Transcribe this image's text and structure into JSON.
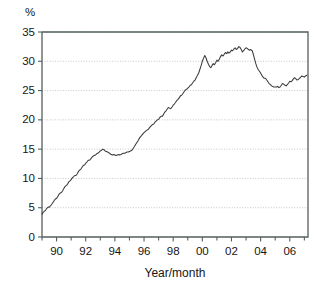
{
  "chart_data": {
    "type": "line",
    "title": "",
    "subtitle": "",
    "xlabel": "Year/month",
    "ylabel": "",
    "unit_label": "%",
    "ylim": [
      0,
      35
    ],
    "xlim": [
      1989.0,
      2007.25
    ],
    "grid": true,
    "legend": false,
    "legend_position": "none",
    "yticks": [
      0,
      5,
      10,
      15,
      20,
      25,
      30,
      35
    ],
    "ytick_labels": [
      "0",
      "5",
      "10",
      "15",
      "20",
      "25",
      "30",
      "35"
    ],
    "xticks": [
      1990,
      1992,
      1994,
      1996,
      1998,
      2000,
      2002,
      2004,
      2006
    ],
    "xtick_labels": [
      "90",
      "92",
      "94",
      "96",
      "98",
      "00",
      "02",
      "04",
      "06"
    ],
    "xtick_minor": [
      1989,
      1991,
      1993,
      1995,
      1997,
      1999,
      2001,
      2003,
      2005,
      2007
    ],
    "line_color": "#3a3a3a",
    "grid_color": "#b9b9b9",
    "axis_color": "#555f5f",
    "series": [
      {
        "name": "percentage",
        "x": [
          1989.0,
          1989.08,
          1989.17,
          1989.25,
          1989.33,
          1989.42,
          1989.5,
          1989.58,
          1989.67,
          1989.75,
          1989.83,
          1989.92,
          1990.0,
          1990.08,
          1990.17,
          1990.25,
          1990.33,
          1990.42,
          1990.5,
          1990.58,
          1990.67,
          1990.75,
          1990.83,
          1990.92,
          1991.0,
          1991.08,
          1991.17,
          1991.25,
          1991.33,
          1991.42,
          1991.5,
          1991.58,
          1991.67,
          1991.75,
          1991.83,
          1991.92,
          1992.0,
          1992.08,
          1992.17,
          1992.25,
          1992.33,
          1992.42,
          1992.5,
          1992.58,
          1992.67,
          1992.75,
          1992.83,
          1992.92,
          1993.0,
          1993.08,
          1993.17,
          1993.25,
          1993.33,
          1993.42,
          1993.5,
          1993.58,
          1993.67,
          1993.75,
          1993.83,
          1993.92,
          1994.0,
          1994.08,
          1994.17,
          1994.25,
          1994.33,
          1994.42,
          1994.5,
          1994.58,
          1994.67,
          1994.75,
          1994.83,
          1994.92,
          1995.0,
          1995.08,
          1995.17,
          1995.25,
          1995.33,
          1995.42,
          1995.5,
          1995.58,
          1995.67,
          1995.75,
          1995.83,
          1995.92,
          1996.0,
          1996.08,
          1996.17,
          1996.25,
          1996.33,
          1996.42,
          1996.5,
          1996.58,
          1996.67,
          1996.75,
          1996.83,
          1996.92,
          1997.0,
          1997.08,
          1997.17,
          1997.25,
          1997.33,
          1997.42,
          1997.5,
          1997.58,
          1997.67,
          1997.75,
          1997.83,
          1997.92,
          1998.0,
          1998.08,
          1998.17,
          1998.25,
          1998.33,
          1998.42,
          1998.5,
          1998.58,
          1998.67,
          1998.75,
          1998.83,
          1998.92,
          1999.0,
          1999.08,
          1999.17,
          1999.25,
          1999.33,
          1999.42,
          1999.5,
          1999.58,
          1999.67,
          1999.75,
          1999.83,
          1999.92,
          2000.0,
          2000.08,
          2000.17,
          2000.25,
          2000.33,
          2000.42,
          2000.5,
          2000.58,
          2000.67,
          2000.75,
          2000.83,
          2000.92,
          2001.0,
          2001.08,
          2001.17,
          2001.25,
          2001.33,
          2001.42,
          2001.5,
          2001.58,
          2001.67,
          2001.75,
          2001.83,
          2001.92,
          2002.0,
          2002.08,
          2002.17,
          2002.25,
          2002.33,
          2002.42,
          2002.5,
          2002.58,
          2002.67,
          2002.75,
          2002.83,
          2002.92,
          2003.0,
          2003.08,
          2003.17,
          2003.25,
          2003.33,
          2003.42,
          2003.5,
          2003.58,
          2003.67,
          2003.75,
          2003.83,
          2003.92,
          2004.0,
          2004.08,
          2004.17,
          2004.25,
          2004.33,
          2004.42,
          2004.5,
          2004.58,
          2004.67,
          2004.75,
          2004.83,
          2004.92,
          2005.0,
          2005.08,
          2005.17,
          2005.25,
          2005.33,
          2005.42,
          2005.5,
          2005.58,
          2005.67,
          2005.75,
          2005.83,
          2005.92,
          2006.0,
          2006.08,
          2006.17,
          2006.25,
          2006.33,
          2006.42,
          2006.5,
          2006.58,
          2006.67,
          2006.75,
          2006.83,
          2006.92,
          2007.0,
          2007.08,
          2007.17
        ],
        "y": [
          3.9,
          4.2,
          4.4,
          4.6,
          4.9,
          5.1,
          5.1,
          5.3,
          5.6,
          5.9,
          6.2,
          6.5,
          6.6,
          6.9,
          7.3,
          7.5,
          7.6,
          7.9,
          8.3,
          8.6,
          8.8,
          9.0,
          9.4,
          9.6,
          9.8,
          10.1,
          10.3,
          10.5,
          10.5,
          10.8,
          11.2,
          11.4,
          11.6,
          11.9,
          12.2,
          12.3,
          12.6,
          12.8,
          13.1,
          13.1,
          13.3,
          13.6,
          13.8,
          13.9,
          14.0,
          14.2,
          14.3,
          14.5,
          14.7,
          14.8,
          15.0,
          14.9,
          14.7,
          14.6,
          14.5,
          14.4,
          14.2,
          14.1,
          14.0,
          14.1,
          14.0,
          13.9,
          14.0,
          14.1,
          14.0,
          14.1,
          14.2,
          14.3,
          14.3,
          14.4,
          14.5,
          14.5,
          14.6,
          14.7,
          14.8,
          15.1,
          15.4,
          15.8,
          16.1,
          16.4,
          16.8,
          17.1,
          17.3,
          17.6,
          17.8,
          18.0,
          18.2,
          18.3,
          18.5,
          18.8,
          19.0,
          19.2,
          19.3,
          19.6,
          19.8,
          20.0,
          20.1,
          20.4,
          20.6,
          20.6,
          20.9,
          21.3,
          21.5,
          21.8,
          22.1,
          22.0,
          21.9,
          22.2,
          22.5,
          22.7,
          23.0,
          23.3,
          23.5,
          23.8,
          24.1,
          24.2,
          24.5,
          24.8,
          25.1,
          25.2,
          25.4,
          25.6,
          25.9,
          26.0,
          26.3,
          26.6,
          26.8,
          27.2,
          27.6,
          28.0,
          28.6,
          29.3,
          30.0,
          30.5,
          31.0,
          30.6,
          30.0,
          29.5,
          29.1,
          28.9,
          29.3,
          29.6,
          29.4,
          29.8,
          30.2,
          30.0,
          30.4,
          30.8,
          31.1,
          30.9,
          31.2,
          31.5,
          31.3,
          31.6,
          31.4,
          31.6,
          31.9,
          31.8,
          32.1,
          32.3,
          32.0,
          32.2,
          32.5,
          32.4,
          32.0,
          31.6,
          31.8,
          32.1,
          32.3,
          32.2,
          32.0,
          31.9,
          32.0,
          31.8,
          31.2,
          30.4,
          29.6,
          29.0,
          28.6,
          28.3,
          28.0,
          27.6,
          27.3,
          27.1,
          27.1,
          26.8,
          26.5,
          26.2,
          26.0,
          25.8,
          25.7,
          25.6,
          25.6,
          25.6,
          25.7,
          25.5,
          25.6,
          25.9,
          26.2,
          26.1,
          25.9,
          25.8,
          26.0,
          26.3,
          26.6,
          26.5,
          26.7,
          27.0,
          27.2,
          27.0,
          26.8,
          26.9,
          27.1,
          27.3,
          27.5,
          27.4,
          27.3,
          27.5,
          27.6
        ]
      }
    ]
  }
}
